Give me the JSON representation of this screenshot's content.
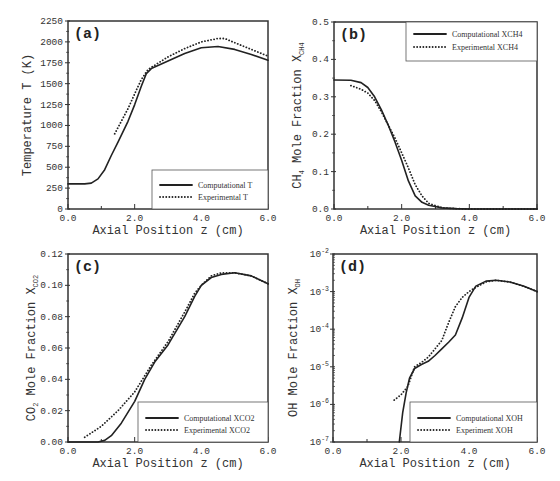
{
  "chart_data": [
    {
      "type": "line",
      "panel": "(a)",
      "xlabel": "Axial Position z (cm)",
      "ylabel": "Temperature T (K)",
      "ylabel_sub": "",
      "xlim": [
        0,
        6
      ],
      "ylim": [
        0,
        2250
      ],
      "yscale": "linear",
      "xticks": [
        0,
        2,
        4,
        6
      ],
      "xtick_labels": [
        "0.0",
        "2.0",
        "4.0",
        "6.0"
      ],
      "yticks": [
        0,
        250,
        500,
        750,
        1000,
        1250,
        1500,
        1750,
        2000,
        2250
      ],
      "ytick_labels": [
        "0",
        "250",
        "500",
        "750",
        "1000",
        "1250",
        "1500",
        "1750",
        "2000",
        "2250"
      ],
      "legend_position": "bottom-right",
      "series": [
        {
          "name": "Computational T",
          "style": "solid",
          "x": [
            0,
            0.5,
            0.7,
            0.9,
            1.1,
            1.3,
            1.5,
            1.8,
            2.0,
            2.2,
            2.35,
            2.5,
            3.0,
            3.5,
            4.0,
            4.5,
            5.0,
            5.5,
            6.0
          ],
          "y": [
            300,
            300,
            310,
            360,
            470,
            640,
            800,
            1050,
            1250,
            1470,
            1620,
            1680,
            1770,
            1860,
            1930,
            1945,
            1910,
            1850,
            1780
          ]
        },
        {
          "name": "Experimental T",
          "style": "dotted",
          "x": [
            1.4,
            1.6,
            1.8,
            2.0,
            2.2,
            2.4,
            2.6,
            3.0,
            3.5,
            4.0,
            4.5,
            4.7,
            5.0,
            5.5,
            6.0
          ],
          "y": [
            900,
            1050,
            1200,
            1380,
            1550,
            1670,
            1720,
            1820,
            1920,
            2000,
            2040,
            2040,
            1990,
            1910,
            1830
          ]
        }
      ]
    },
    {
      "type": "line",
      "panel": "(b)",
      "xlabel": "Axial Position z (cm)",
      "ylabel": "CH4 Mole Fraction XCH4",
      "xlim": [
        0,
        6
      ],
      "ylim": [
        0,
        0.5
      ],
      "yscale": "linear",
      "xticks": [
        0,
        2,
        4,
        6
      ],
      "xtick_labels": [
        "0.0",
        "2.0",
        "4.0",
        "6.0"
      ],
      "yticks": [
        0,
        0.1,
        0.2,
        0.3,
        0.4,
        0.5
      ],
      "ytick_labels": [
        "0.0",
        "0.1",
        "0.2",
        "0.3",
        "0.4",
        "0.5"
      ],
      "legend_position": "top-right",
      "series": [
        {
          "name": "Computational XCH4",
          "style": "solid",
          "x": [
            0,
            0.5,
            0.8,
            1.0,
            1.2,
            1.4,
            1.6,
            1.8,
            2.0,
            2.2,
            2.4,
            2.6,
            2.8,
            3.2,
            3.6,
            4.0,
            5.0,
            6.0
          ],
          "y": [
            0.345,
            0.344,
            0.338,
            0.325,
            0.3,
            0.265,
            0.225,
            0.18,
            0.13,
            0.075,
            0.035,
            0.018,
            0.01,
            0.003,
            0.001,
            0,
            0,
            0
          ]
        },
        {
          "name": "Experimental XCH4",
          "style": "dotted",
          "x": [
            0.5,
            0.8,
            1.0,
            1.2,
            1.4,
            1.6,
            1.8,
            2.0,
            2.2,
            2.4,
            2.6,
            2.8,
            3.2,
            3.6,
            4.0,
            5.0,
            6.0
          ],
          "y": [
            0.33,
            0.32,
            0.31,
            0.29,
            0.26,
            0.225,
            0.19,
            0.15,
            0.11,
            0.065,
            0.035,
            0.015,
            0.003,
            0.001,
            0,
            0,
            0
          ]
        }
      ]
    },
    {
      "type": "line",
      "panel": "(c)",
      "xlabel": "Axial Position z (cm)",
      "ylabel": "CO2 Mole Fraction XCO2",
      "xlim": [
        0,
        6
      ],
      "ylim": [
        0,
        0.12
      ],
      "yscale": "linear",
      "xticks": [
        0,
        2,
        4,
        6
      ],
      "xtick_labels": [
        "0.0",
        "2.0",
        "4.0",
        "6.0"
      ],
      "yticks": [
        0,
        0.02,
        0.04,
        0.06,
        0.08,
        0.1,
        0.12
      ],
      "ytick_labels": [
        "0.00",
        "0.02",
        "0.04",
        "0.06",
        "0.08",
        "0.10",
        "0.12"
      ],
      "legend_position": "bottom-right",
      "series": [
        {
          "name": "Computational XCO2",
          "style": "solid",
          "x": [
            0,
            0.9,
            1.1,
            1.3,
            1.6,
            2.0,
            2.3,
            2.6,
            3.0,
            3.5,
            3.8,
            4.0,
            4.3,
            4.6,
            5.0,
            5.5,
            6.0
          ],
          "y": [
            0,
            0,
            0.001,
            0.004,
            0.012,
            0.026,
            0.04,
            0.051,
            0.062,
            0.08,
            0.093,
            0.1,
            0.105,
            0.107,
            0.108,
            0.106,
            0.101
          ]
        },
        {
          "name": "Experimental XCO2",
          "style": "dotted",
          "x": [
            0.5,
            1.0,
            1.5,
            2.0,
            2.5,
            3.0,
            3.5,
            3.8,
            4.0,
            4.3,
            4.6,
            5.0,
            5.5,
            6.0
          ],
          "y": [
            0.003,
            0.01,
            0.02,
            0.032,
            0.049,
            0.064,
            0.083,
            0.095,
            0.1,
            0.106,
            0.108,
            0.108,
            0.106,
            0.101
          ]
        }
      ]
    },
    {
      "type": "line",
      "panel": "(d)",
      "xlabel": "Axial Position z (cm)",
      "ylabel": "OH Mole Fraction XOH",
      "xlim": [
        0,
        6
      ],
      "ylim": [
        1e-07,
        0.01
      ],
      "yscale": "log",
      "xticks": [
        0,
        2,
        4,
        6
      ],
      "xtick_labels": [
        "0.0",
        "2.0",
        "4.0",
        "6.0"
      ],
      "yticks": [
        1e-07,
        1e-06,
        1e-05,
        0.0001,
        0.001,
        0.01
      ],
      "ytick_labels": [
        "10-7",
        "10-6",
        "10-5",
        "10-4",
        "10-3",
        "10-2"
      ],
      "legend_position": "bottom-right",
      "series": [
        {
          "name": "Computational XOH",
          "style": "solid",
          "x": [
            1.95,
            2.05,
            2.15,
            2.25,
            2.4,
            2.6,
            2.8,
            3.0,
            3.2,
            3.4,
            3.6,
            3.8,
            4.0,
            4.2,
            4.5,
            4.8,
            5.2,
            5.6,
            6.0
          ],
          "y": [
            1e-07,
            6e-07,
            2e-06,
            5e-06,
            9e-06,
            1.15e-05,
            1.4e-05,
            2e-05,
            3e-05,
            4.5e-05,
            7e-05,
            0.0002,
            0.0007,
            0.0014,
            0.0019,
            0.002,
            0.0018,
            0.0014,
            0.001
          ]
        },
        {
          "name": "Experiment XOH",
          "style": "dotted",
          "x": [
            1.8,
            2.0,
            2.2,
            2.4,
            2.6,
            2.8,
            3.0,
            3.2,
            3.4,
            3.6,
            3.8,
            4.0,
            4.2,
            4.5,
            4.8,
            5.2,
            5.6,
            6.0
          ],
          "y": [
            1.3e-06,
            1.8e-06,
            3e-06,
            1e-05,
            1.3e-05,
            1.8e-05,
            3e-05,
            5e-05,
            0.00015,
            0.0004,
            0.0007,
            0.001,
            0.0013,
            0.0018,
            0.002,
            0.0018,
            0.0014,
            0.001
          ]
        }
      ]
    }
  ],
  "labels": {
    "xlabel": "Axial Position z (cm)",
    "a": {
      "tag": "(a)",
      "ylabel": "Temperature T (K)",
      "legend": [
        "Computational T",
        "Experimental T"
      ]
    },
    "b": {
      "tag": "(b)",
      "ylabel_main": "CH",
      "ylabel_sub1": "4",
      "ylabel_mid": " Mole Fraction X",
      "ylabel_sub2": "CH4",
      "legend": [
        "Computational XCH4",
        "Experimental XCH4"
      ]
    },
    "c": {
      "tag": "(c)",
      "ylabel_main": "CO",
      "ylabel_sub1": "2",
      "ylabel_mid": " Mole Fraction X",
      "ylabel_sub2": "CO2",
      "legend": [
        "Computational XCO2",
        "Experimental XCO2"
      ]
    },
    "d": {
      "tag": "(d)",
      "ylabel_main": "OH Mole Fraction X",
      "ylabel_sub2": "OH",
      "legend": [
        "Computational XOH",
        "Experiment XOH"
      ]
    }
  }
}
